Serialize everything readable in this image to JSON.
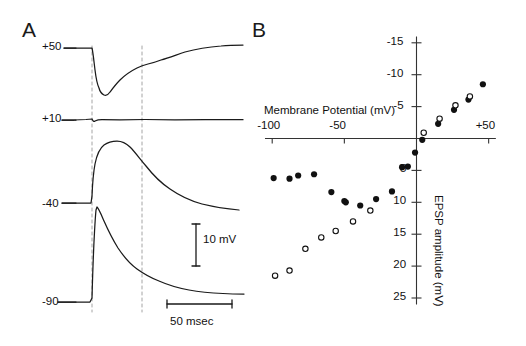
{
  "figure": {
    "panels": [
      {
        "id": "A",
        "letter": "A"
      },
      {
        "id": "B",
        "letter": "B"
      }
    ]
  },
  "panel_a": {
    "letter": "A",
    "trace_labels": [
      "+50",
      "+10",
      "-40",
      "-90"
    ],
    "trace_label_units": "mV",
    "scale_bars": {
      "vertical_label": "10 mV",
      "horizontal_label": "50 msec"
    },
    "dashed_cursor_count": 2
  },
  "panel_b": {
    "letter": "B"
  },
  "chart_data": {
    "type": "scatter",
    "title": "",
    "xlabel": "Membrane Potential (mV)",
    "ylabel": "EPSP amplitude (mV)",
    "xlim": [
      -105,
      55
    ],
    "ylim": [
      -16,
      26
    ],
    "y_axis_inverted": true,
    "xticks": [
      -100,
      -50,
      50
    ],
    "xtick_labels": [
      "-100",
      "-50",
      "+50"
    ],
    "yticks": [
      -15,
      -10,
      -5,
      5,
      10,
      15,
      20,
      25
    ],
    "ytick_labels": [
      "-15",
      "-10",
      "-5",
      "10",
      "15",
      "20",
      "25"
    ],
    "grid": false,
    "legend": false,
    "axis_origin": {
      "x": 0,
      "y": 0
    },
    "series": [
      {
        "name": "filled",
        "marker": "filled-circle",
        "color": "#111111",
        "points": [
          {
            "x": -99,
            "y": 6.2
          },
          {
            "x": -88,
            "y": 6.3
          },
          {
            "x": -82,
            "y": 5.8
          },
          {
            "x": -71,
            "y": 5.6
          },
          {
            "x": -59,
            "y": 8.4
          },
          {
            "x": -50,
            "y": 9.8
          },
          {
            "x": -49,
            "y": 10.0
          },
          {
            "x": -39,
            "y": 10.5
          },
          {
            "x": -28,
            "y": 9.5
          },
          {
            "x": -17,
            "y": 8.3
          },
          {
            "x": -6,
            "y": 4.4
          },
          {
            "x": -10,
            "y": 4.5
          },
          {
            "x": -1,
            "y": 2.2
          },
          {
            "x": 4,
            "y": 0.2
          },
          {
            "x": 15,
            "y": -2.3
          },
          {
            "x": 26,
            "y": -4.5
          },
          {
            "x": 36,
            "y": -6.1
          },
          {
            "x": 46,
            "y": -8.5
          }
        ]
      },
      {
        "name": "open",
        "marker": "open-circle",
        "color": "#111111",
        "points": [
          {
            "x": -98,
            "y": 21.5
          },
          {
            "x": -88,
            "y": 20.7
          },
          {
            "x": -77,
            "y": 17.3
          },
          {
            "x": -66,
            "y": 15.5
          },
          {
            "x": -56,
            "y": 14.5
          },
          {
            "x": -44,
            "y": 13.0
          },
          {
            "x": -32,
            "y": 11.3
          },
          {
            "x": 5,
            "y": -0.9
          },
          {
            "x": 16,
            "y": -3.1
          },
          {
            "x": 27,
            "y": -5.2
          },
          {
            "x": 37,
            "y": -6.6
          }
        ]
      }
    ]
  }
}
